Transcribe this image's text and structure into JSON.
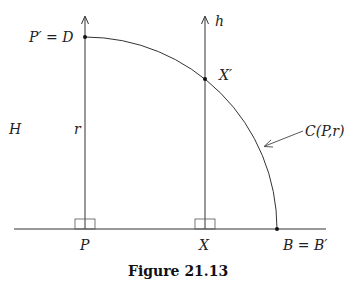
{
  "figure": {
    "caption": "Figure 21.13",
    "labels": {
      "p_prime_eq_d": "P′ = D",
      "h": "h",
      "x_prime": "X′",
      "big_h": "H",
      "r": "r",
      "circle": "C(P,r)",
      "p": "P",
      "x": "X",
      "b_eq_b_prime": "B = B′"
    },
    "colors": {
      "stroke": "#333333",
      "background": "#ffffff"
    },
    "geometry": {
      "baseline": {
        "x1": 14,
        "x2": 326,
        "y": 229
      },
      "center_P": [
        85,
        229
      ],
      "radius": 192,
      "point_D": [
        85,
        37
      ],
      "point_X_prime": [
        205,
        79
      ],
      "point_B": [
        277,
        229
      ],
      "vertical_P_x": 85,
      "vertical_X_x": 205
    }
  }
}
